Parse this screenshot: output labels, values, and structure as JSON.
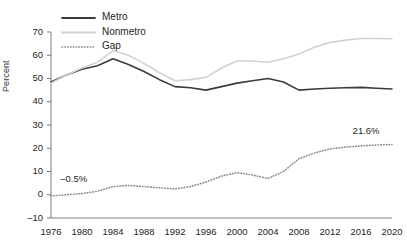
{
  "chart_data": {
    "type": "line",
    "title": "",
    "xlabel": "",
    "ylabel": "Percent",
    "xlim": [
      1976,
      2020
    ],
    "ylim": [
      -10,
      70
    ],
    "ytick_values": [
      -10,
      0,
      10,
      20,
      30,
      40,
      50,
      60,
      70
    ],
    "ytick_labels": [
      "–10",
      "0",
      "10",
      "20",
      "30",
      "40",
      "50",
      "60",
      "70"
    ],
    "xtick_values": [
      1976,
      1980,
      1984,
      1988,
      1992,
      1996,
      2000,
      2004,
      2008,
      2012,
      2016,
      2020
    ],
    "xtick_labels": [
      "1976",
      "1980",
      "1984",
      "1988",
      "1992",
      "1996",
      "2000",
      "2004",
      "2008",
      "2012",
      "2016",
      "2020"
    ],
    "grid": false,
    "legend_position": "top-left",
    "x": [
      1976,
      1978,
      1980,
      1982,
      1984,
      1986,
      1988,
      1990,
      1992,
      1994,
      1996,
      1998,
      2000,
      2002,
      2004,
      2006,
      2008,
      2010,
      2012,
      2014,
      2016,
      2018,
      2020
    ],
    "series": [
      {
        "name": "Metro",
        "color": "#3b3b3b",
        "style": "solid",
        "values": [
          48.5,
          51.5,
          54.0,
          55.5,
          58.5,
          56.0,
          53.0,
          49.5,
          46.5,
          46.0,
          45.0,
          46.5,
          48.0,
          49.0,
          50.0,
          48.5,
          45.0,
          45.5,
          45.8,
          46.0,
          46.2,
          45.8,
          45.5
        ]
      },
      {
        "name": "Nonmetro",
        "color": "#d2d2d2",
        "style": "solid",
        "values": [
          48.0,
          51.5,
          54.5,
          57.0,
          62.0,
          60.0,
          56.5,
          52.5,
          49.0,
          49.5,
          50.5,
          54.5,
          57.5,
          57.5,
          57.0,
          58.5,
          60.5,
          63.5,
          65.5,
          66.5,
          67.2,
          67.2,
          67.1
        ]
      },
      {
        "name": "Gap",
        "color": "#8d8d8d",
        "style": "dotted",
        "values": [
          -0.5,
          0.0,
          0.5,
          1.5,
          3.5,
          4.0,
          3.5,
          3.0,
          2.5,
          3.5,
          5.5,
          8.0,
          9.5,
          8.5,
          7.0,
          10.0,
          15.5,
          18.0,
          19.7,
          20.5,
          21.0,
          21.4,
          21.6
        ]
      }
    ],
    "annotations": [
      {
        "text": "–0.5%",
        "x": 1977.2,
        "y": 6.5,
        "anchor": "start"
      },
      {
        "text": "21.6%",
        "x": 2018.4,
        "y": 27.0,
        "anchor": "end"
      }
    ],
    "legend": [
      {
        "label": "Metro",
        "color": "#3b3b3b",
        "style": "solid"
      },
      {
        "label": "Nonmetro",
        "color": "#d2d2d2",
        "style": "solid"
      },
      {
        "label": "Gap",
        "color": "#8d8d8d",
        "style": "dotted"
      }
    ]
  }
}
